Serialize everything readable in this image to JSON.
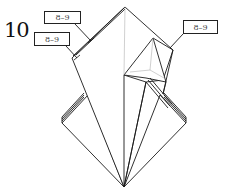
{
  "diagram": {
    "step_number": "10",
    "references": [
      {
        "label": "8–9",
        "position": "upper-left"
      },
      {
        "label": "8–9",
        "position": "left"
      },
      {
        "label": "8–9",
        "position": "right"
      }
    ],
    "colors": {
      "line": "#1a1a1a",
      "crease": "#b0b0b0",
      "paper": "#ffffff"
    }
  }
}
